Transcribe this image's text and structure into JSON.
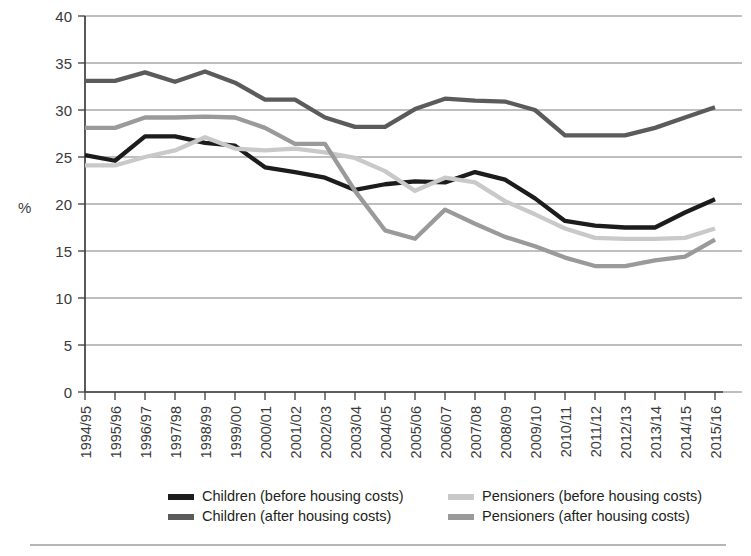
{
  "chart_data": {
    "type": "line",
    "title": "",
    "xlabel": "",
    "ylabel": "%",
    "ylim": [
      0,
      40
    ],
    "ytick_step": 5,
    "yticks": [
      "0",
      "5",
      "10",
      "15",
      "20",
      "25",
      "30",
      "35",
      "40"
    ],
    "grid": true,
    "legend_position": "bottom",
    "categories": [
      "1994/95",
      "1995/96",
      "1996/97",
      "1997/98",
      "1998/99",
      "1999/00",
      "2000/01",
      "2001/02",
      "2002/03",
      "2003/04",
      "2004/05",
      "2005/06",
      "2006/07",
      "2007/08",
      "2008/09",
      "2009/10",
      "2010/11",
      "2011/12",
      "2012/13",
      "2013/14",
      "2014/15",
      "2015/16"
    ],
    "series": [
      {
        "name": "Children (before housing costs)",
        "color": "#1c1c1c",
        "values": [
          25.2,
          24.6,
          27.2,
          27.2,
          26.5,
          26.2,
          23.9,
          23.4,
          22.8,
          21.5,
          22.1,
          22.4,
          22.3,
          23.4,
          22.6,
          20.6,
          18.2,
          17.7,
          17.5,
          17.5,
          19.1,
          20.5
        ]
      },
      {
        "name": "Children (after housing costs)",
        "color": "#5b5b5b",
        "values": [
          33.1,
          33.1,
          34.0,
          33.0,
          34.1,
          32.9,
          31.1,
          31.1,
          29.2,
          28.2,
          28.2,
          30.1,
          31.2,
          31.0,
          30.9,
          30.0,
          27.3,
          27.3,
          27.3,
          28.1,
          29.2,
          30.3
        ]
      },
      {
        "name": "Pensioners (before housing costs)",
        "color": "#c9c9c9",
        "values": [
          24.1,
          24.1,
          25.0,
          25.7,
          27.1,
          25.9,
          25.7,
          25.9,
          25.5,
          24.9,
          23.5,
          21.4,
          22.8,
          22.3,
          20.3,
          18.9,
          17.4,
          16.4,
          16.3,
          16.3,
          16.4,
          17.4
        ]
      },
      {
        "name": "Pensioners (after housing costs)",
        "color": "#9a9a9a",
        "values": [
          28.1,
          28.1,
          29.2,
          29.2,
          29.3,
          29.2,
          28.1,
          26.4,
          26.4,
          21.4,
          17.2,
          16.3,
          19.4,
          17.9,
          16.5,
          15.5,
          14.3,
          13.4,
          13.4,
          14.0,
          14.4,
          16.2
        ]
      }
    ]
  },
  "legend": {
    "items": [
      {
        "label": "Children (before housing costs)",
        "color": "#1c1c1c"
      },
      {
        "label": "Children (after housing costs)",
        "color": "#5b5b5b"
      },
      {
        "label": "Pensioners (before housing costs)",
        "color": "#c9c9c9"
      },
      {
        "label": "Pensioners (after housing costs)",
        "color": "#9a9a9a"
      }
    ]
  }
}
